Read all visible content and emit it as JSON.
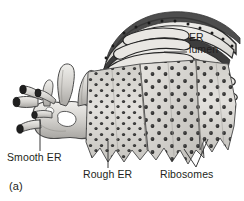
{
  "figure": {
    "panel_marker": "(a)",
    "style": "grayscale-textbook-illustration"
  },
  "labels": {
    "er_lumen_line1": "ER",
    "er_lumen_line2": "lumen",
    "smooth_er": "Smooth ER",
    "rough_er": "Rough ER",
    "ribosomes": "Ribosomes"
  },
  "colors": {
    "background": "#ffffff",
    "text": "#231f20",
    "leader_line": "#3b3b3b",
    "membrane_dark": "#2b2b2b",
    "membrane_mid": "#8c8c8c",
    "membrane_light": "#d8d6d2",
    "lumen_fill": "#e8e6e2",
    "sheet_fill": "#dedcd8",
    "sheet_shadow": "#a9a7a3",
    "ribosome_dot": "#1c1c1c",
    "tube_fill": "#cfcdc9",
    "tube_opening": "#1f1f1f"
  },
  "structures": [
    {
      "name": "smooth-er",
      "description": "smooth tubular network with open tube ends, no ribosomes",
      "region": "left"
    },
    {
      "name": "rough-er",
      "description": "flattened cisternae sheets studded with ribosomes, scalloped edges",
      "region": "center-right"
    },
    {
      "name": "er-lumen",
      "description": "interior space enclosed between cisternal membranes",
      "region": "upper-right"
    },
    {
      "name": "ribosomes",
      "description": "dark dots covering the cytosolic face of rough ER",
      "region": "lower-right"
    }
  ]
}
